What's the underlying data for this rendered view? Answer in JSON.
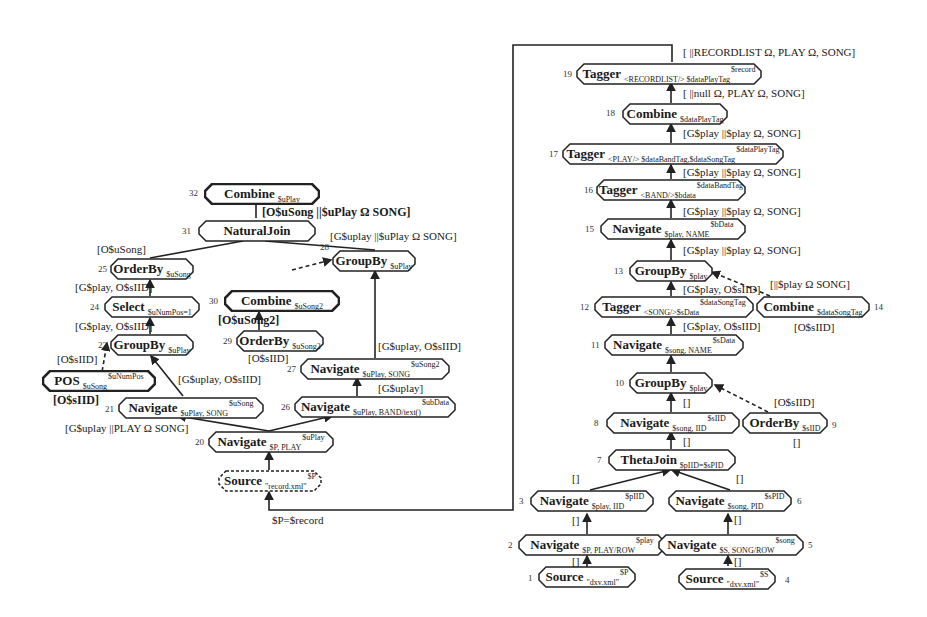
{
  "diagram": {
    "nodes": [
      {
        "id": 1,
        "op": "Source",
        "sub": "\"dxv.xml\"",
        "sup": "$P"
      },
      {
        "id": 2,
        "op": "Navigate",
        "sub": "$P, PLAY/ROW",
        "sup": "$play"
      },
      {
        "id": 3,
        "op": "Navigate",
        "sub": "$play, IID",
        "sup": "$pIID"
      },
      {
        "id": 4,
        "op": "Source",
        "sub": "\"dxv.xml\"",
        "sup": "$S"
      },
      {
        "id": 5,
        "op": "Navigate",
        "sub": "$S, SONG/ROW",
        "sup": "$song"
      },
      {
        "id": 6,
        "op": "Navigate",
        "sub": "$song, PID",
        "sup": "$sPID"
      },
      {
        "id": 7,
        "op": "ThetaJoin",
        "sub": "$pIID=$sPID",
        "sup": ""
      },
      {
        "id": 8,
        "op": "Navigate",
        "sub": "$song, IID",
        "sup": "$sIID"
      },
      {
        "id": 9,
        "op": "OrderBy",
        "sub": "$sIID",
        "sup": ""
      },
      {
        "id": 10,
        "op": "GroupBy",
        "sub": "$play",
        "sup": ""
      },
      {
        "id": 11,
        "op": "Navigate",
        "sub": "$song, NAME",
        "sup": "$sData"
      },
      {
        "id": 12,
        "op": "Tagger",
        "sub": "<SONG/>$sData",
        "sup": "$dataSongTag"
      },
      {
        "id": 13,
        "op": "GroupBy",
        "sub": "$play",
        "sup": ""
      },
      {
        "id": 14,
        "op": "Combine",
        "sub": "$dataSongTag",
        "sup": ""
      },
      {
        "id": 15,
        "op": "Navigate",
        "sub": "$play, NAME",
        "sup": "$bData"
      },
      {
        "id": 16,
        "op": "Tagger",
        "sub": "<BAND/>$bdata",
        "sup": "$dataBandTag"
      },
      {
        "id": 17,
        "op": "Tagger",
        "sub": "<PLAY/> $dataBandTag,$dataSongTag",
        "sup": "$dataPlayTag"
      },
      {
        "id": 18,
        "op": "Combine",
        "sub": "$dataPlayTag",
        "sup": ""
      },
      {
        "id": 19,
        "op": "Tagger",
        "sub": "<RECORDLIST/> $dataPlayTag",
        "sup": "$record"
      },
      {
        "id": 20,
        "op": "Navigate",
        "sub": "$P, PLAY",
        "sup": "$uPlay"
      },
      {
        "id": 21,
        "op": "Navigate",
        "sub": "$uPlay, SONG",
        "sup": "$uSong"
      },
      {
        "id": 22,
        "op": "POS",
        "sub": "$uSong",
        "sup": "$uNumPos"
      },
      {
        "id": 23,
        "op": "GroupBy",
        "sub": "$uPlay",
        "sup": ""
      },
      {
        "id": 24,
        "op": "Select",
        "sub": "$uNumPos=1",
        "sup": ""
      },
      {
        "id": 25,
        "op": "OrderBy",
        "sub": "$uSong",
        "sup": ""
      },
      {
        "id": 26,
        "op": "Navigate",
        "sub": "$uPlay, BAND/text()",
        "sup": "$ubData"
      },
      {
        "id": 27,
        "op": "Navigate",
        "sub": "$uPlay, SONG",
        "sup": "$uSong2"
      },
      {
        "id": 28,
        "op": "GroupBy",
        "sub": "$uPlay",
        "sup": ""
      },
      {
        "id": 29,
        "op": "OrderBy",
        "sub": "$uSong2",
        "sup": ""
      },
      {
        "id": 30,
        "op": "Combine",
        "sub": "$uSong2",
        "sup": ""
      },
      {
        "id": 31,
        "op": "NaturalJoin",
        "sub": "",
        "sup": ""
      },
      {
        "id": 32,
        "op": "Combine",
        "sub": "$uPlay",
        "sup": ""
      },
      {
        "id": 0,
        "op": "Source",
        "sub": "\"record.xml\"",
        "sup": "$P"
      }
    ],
    "annotations": {
      "a19_top": "[ ||RECORDLIST Ω, PLAY Ω, SONG]",
      "a18_top": "[ ||null Ω, PLAY Ω, SONG]",
      "a17_top": "[G$play ||$play Ω, SONG]",
      "a16_top": "[G$play ||$play Ω, SONG]",
      "a15_top": "[G$play ||$play Ω, SONG]",
      "a13_top": "[G$play ||$play Ω, SONG]",
      "a14_top": "[||$play Ω SONG]",
      "a12_top": "[G$play, O$sIID]",
      "a11_top": "[G$play, O$sIID]",
      "a14_bot": "[O$sIID]",
      "a9_top": "[O$sIID]",
      "a10_bot": "[]",
      "a8_bot": "[]",
      "a9_bot": "[]",
      "a7_left": "[]",
      "a7_right": "[]",
      "a3_bot": "[]",
      "a2_bot": "[]",
      "a6_bot": "[]",
      "a5_bot": "[]",
      "a32_bot": "[O$uSong ||$uPlay Ω SONG]",
      "a28_top": "[G$uplay ||$uPlay Ω SONG]",
      "a25_top": "[O$uSong]",
      "a24_top": "[G$play, O$sIID]",
      "a23_top": "[G$play, O$sIID]",
      "a22_top": "[O$sIID]",
      "a22_bot": "[O$sIID]",
      "a21_top": "[G$uplay, O$sIID]",
      "a20_top": "[G$uplay ||PLAY Ω SONG]",
      "a30_bot": "[O$uSong2]",
      "a29_bot": "[O$sIID]",
      "a27_top": "[G$uplay, O$sIID]",
      "a26_top": "[G$uplay]",
      "feedback": "$P=$record"
    }
  }
}
